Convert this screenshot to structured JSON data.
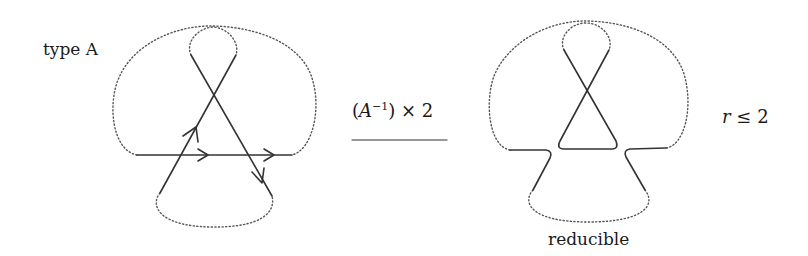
{
  "left_diagram": {
    "label": "type A",
    "description": "oriented curve with triple crossing configuration, dotted arcs indicate connections"
  },
  "operation": {
    "prefix": "(",
    "variable": "A",
    "exponent": "−1",
    "suffix": ") × 2",
    "arrow": "right-arrow"
  },
  "right_diagram": {
    "caption": "reducible",
    "condition_var": "r",
    "condition_rest": " ≤ 2"
  },
  "colors": {
    "stroke": "#333333",
    "dotted": "#555555",
    "text": "#1a1a1a"
  }
}
